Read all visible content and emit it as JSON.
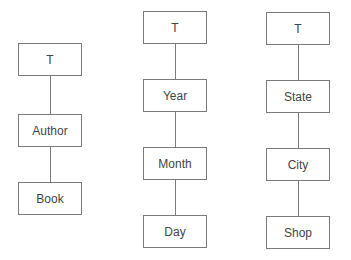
{
  "diagram": {
    "type": "hierarchy-trees",
    "hierarchies": [
      {
        "name": "author-hierarchy",
        "nodes": [
          "T",
          "Author",
          "Book"
        ]
      },
      {
        "name": "time-hierarchy",
        "nodes": [
          "T",
          "Year",
          "Month",
          "Day"
        ]
      },
      {
        "name": "location-hierarchy",
        "nodes": [
          "T",
          "State",
          "City",
          "Shop"
        ]
      }
    ],
    "colors": {
      "border": "#7a7a7a",
      "text": "#444444",
      "background": "#ffffff"
    }
  }
}
